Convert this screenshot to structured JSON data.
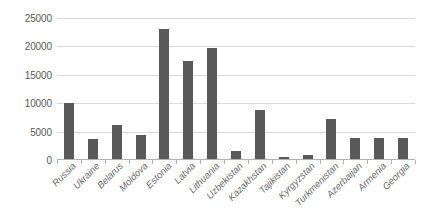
{
  "chart_data": {
    "type": "bar",
    "title": "",
    "subtitle": "",
    "xlabel": "",
    "ylabel": "",
    "ylim": [
      0,
      25000
    ],
    "ytick_labels": [
      "25000",
      "20000",
      "15000",
      "10000",
      "5000",
      "0"
    ],
    "ytick_values": [
      25000,
      20000,
      15000,
      10000,
      5000,
      0
    ],
    "grid": true,
    "legend": false,
    "legend_position": "none",
    "bar_color": "#595959",
    "gridline_color": "#d9d9d9",
    "axis_color": "#b3b3b3",
    "label_color": "#6b6b6b",
    "tick_label_color": "#5a5a5a",
    "background_color": "#ffffff",
    "categories": [
      "Russia",
      "Ukraine",
      "Belarus",
      "Moldova",
      "Estonia",
      "Latvia",
      "Lithuania",
      "Uzbekistan",
      "Kazakhstan",
      "Tajikistan",
      "Kyrgyzstan",
      "Turkmenistan",
      "Azerbaijan",
      "Armenia",
      "Georgia"
    ],
    "values": [
      10000,
      3700,
      6200,
      4400,
      23100,
      17500,
      19800,
      1500,
      8800,
      600,
      900,
      7300,
      3900,
      3900,
      3900
    ]
  }
}
